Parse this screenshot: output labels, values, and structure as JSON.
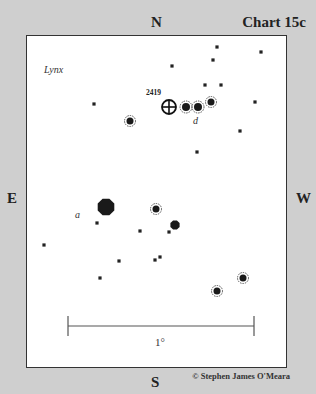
{
  "chart": {
    "title": "Chart 15c",
    "constellation": "Lynx",
    "object_label": "2419",
    "directions": {
      "north": "N",
      "south": "S",
      "east": "E",
      "west": "W"
    },
    "scale_label": "1°",
    "credit": "© Stephen James O'Meara"
  },
  "stars": [
    {
      "x": 217,
      "y": 47,
      "r": 2
    },
    {
      "x": 261,
      "y": 52,
      "r": 2
    },
    {
      "x": 172,
      "y": 66,
      "r": 2
    },
    {
      "x": 213,
      "y": 60,
      "r": 2
    },
    {
      "x": 205,
      "y": 85,
      "r": 2
    },
    {
      "x": 221,
      "y": 85,
      "r": 2
    },
    {
      "x": 255,
      "y": 102,
      "r": 2
    },
    {
      "x": 94,
      "y": 104,
      "r": 2
    },
    {
      "x": 240,
      "y": 131,
      "r": 2
    },
    {
      "x": 197,
      "y": 152,
      "r": 2
    },
    {
      "x": 97,
      "y": 223,
      "r": 2
    },
    {
      "x": 140,
      "y": 231,
      "r": 2
    },
    {
      "x": 169,
      "y": 232,
      "r": 2
    },
    {
      "x": 44,
      "y": 245,
      "r": 2
    },
    {
      "x": 119,
      "y": 261,
      "r": 2
    },
    {
      "x": 155,
      "y": 260,
      "r": 2
    },
    {
      "x": 160,
      "y": 257,
      "r": 2
    },
    {
      "x": 100,
      "y": 278,
      "r": 2
    }
  ],
  "ringed_stars": [
    {
      "x": 186,
      "y": 107,
      "r": 4
    },
    {
      "x": 198,
      "y": 107,
      "r": 4
    },
    {
      "x": 211,
      "y": 102,
      "r": 3.5
    },
    {
      "x": 130,
      "y": 121,
      "r": 3.5
    },
    {
      "x": 156,
      "y": 209,
      "r": 3.5
    },
    {
      "x": 243,
      "y": 278,
      "r": 3.5
    },
    {
      "x": 217,
      "y": 291,
      "r": 3.5
    }
  ],
  "bright_stars": [
    {
      "x": 106,
      "y": 207,
      "r": 9,
      "label": "a",
      "lx": 75,
      "ly": 218
    },
    {
      "x": 175,
      "y": 225,
      "r": 5
    }
  ],
  "cluster": {
    "x": 169,
    "y": 107,
    "r": 7
  },
  "labels": {
    "d": "d"
  }
}
